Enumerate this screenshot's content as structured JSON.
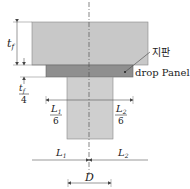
{
  "diagram": {
    "labels": {
      "slab_thickness": "t",
      "slab_thickness_sub": "f",
      "drop_thickness_num": "t",
      "drop_thickness_sub": "f",
      "drop_thickness_den": "4",
      "left_extent_num": "L",
      "left_extent_sub": "1",
      "left_extent_den": "6",
      "right_extent_num": "L",
      "right_extent_sub": "2",
      "right_extent_den": "6",
      "span_left": "L",
      "span_left_sub": "1",
      "span_right": "L",
      "span_right_sub": "2",
      "column_width": "D",
      "korean_label": "지판",
      "drop_panel_label": "drop Panel"
    },
    "colors": {
      "slab": "#c8c8c8",
      "drop_panel": "#8f8f8f",
      "column": "#cfcfcf",
      "line": "#555555"
    }
  }
}
